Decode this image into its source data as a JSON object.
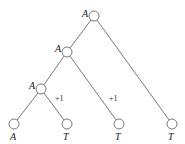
{
  "diagram": {
    "type": "tree",
    "nodes": [
      {
        "id": "root",
        "label": "A",
        "x": 94,
        "y": 16,
        "label_pos": "left"
      },
      {
        "id": "n2",
        "label": "A",
        "x": 67,
        "y": 52,
        "label_pos": "left"
      },
      {
        "id": "n3",
        "label": "A",
        "x": 41,
        "y": 89,
        "label_pos": "left"
      },
      {
        "id": "leaf1",
        "label": "A",
        "x": 14,
        "y": 124,
        "label_pos": "below"
      },
      {
        "id": "leaf2",
        "label": "T",
        "x": 67,
        "y": 124,
        "label_pos": "below"
      },
      {
        "id": "leaf3",
        "label": "T",
        "x": 119,
        "y": 124,
        "label_pos": "below"
      },
      {
        "id": "leaf4",
        "label": "T",
        "x": 172,
        "y": 124,
        "label_pos": "below"
      }
    ],
    "edges": [
      {
        "from": "root",
        "to": "n2",
        "weight": ""
      },
      {
        "from": "root",
        "to": "leaf4",
        "weight": ""
      },
      {
        "from": "n2",
        "to": "n3",
        "weight": ""
      },
      {
        "from": "n2",
        "to": "leaf3",
        "weight": "+1"
      },
      {
        "from": "n3",
        "to": "leaf1",
        "weight": ""
      },
      {
        "from": "n3",
        "to": "leaf2",
        "weight": "+1"
      }
    ],
    "labels": {
      "root": "A",
      "n2": "A",
      "n3": "A",
      "leaf1": "A",
      "leaf2": "T",
      "leaf3": "T",
      "leaf4": "T",
      "weight_n3_leaf2": "+1",
      "weight_n2_leaf3": "+1"
    }
  }
}
